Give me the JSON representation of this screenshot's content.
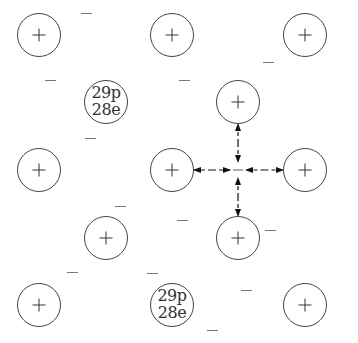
{
  "diagram": {
    "ion_radius": 22,
    "ions": [
      {
        "id": "ion-r1-c1",
        "x": 39,
        "y": 35,
        "symbol": "+"
      },
      {
        "id": "ion-r1-c2",
        "x": 172,
        "y": 35,
        "symbol": "+"
      },
      {
        "id": "ion-r1-c3",
        "x": 305,
        "y": 35,
        "symbol": "+"
      },
      {
        "id": "ion-r2-c1",
        "x": 106,
        "y": 102,
        "symbol": null,
        "label_line1": "29p",
        "label_line2": "28e"
      },
      {
        "id": "ion-r2-c2",
        "x": 238,
        "y": 102,
        "symbol": "+"
      },
      {
        "id": "ion-r3-c1",
        "x": 39,
        "y": 170,
        "symbol": "+"
      },
      {
        "id": "ion-r3-c2",
        "x": 172,
        "y": 170,
        "symbol": "+"
      },
      {
        "id": "ion-r3-c3",
        "x": 305,
        "y": 170,
        "symbol": "+"
      },
      {
        "id": "ion-r4-c1",
        "x": 106,
        "y": 238,
        "symbol": "+"
      },
      {
        "id": "ion-r4-c2",
        "x": 238,
        "y": 238,
        "symbol": "+"
      },
      {
        "id": "ion-r5-c1",
        "x": 39,
        "y": 305,
        "symbol": "+"
      },
      {
        "id": "ion-r5-c2",
        "x": 172,
        "y": 305,
        "symbol": null,
        "label_line1": "29p",
        "label_line2": "28e"
      },
      {
        "id": "ion-r5-c3",
        "x": 305,
        "y": 305,
        "symbol": "+"
      }
    ],
    "electrons": [
      {
        "x": 86,
        "y": 13
      },
      {
        "x": 50,
        "y": 80
      },
      {
        "x": 184,
        "y": 80
      },
      {
        "x": 268,
        "y": 62
      },
      {
        "x": 90,
        "y": 138
      },
      {
        "x": 120,
        "y": 206
      },
      {
        "x": 182,
        "y": 220
      },
      {
        "x": 270,
        "y": 230
      },
      {
        "x": 72,
        "y": 272
      },
      {
        "x": 152,
        "y": 273
      },
      {
        "x": 246,
        "y": 290
      },
      {
        "x": 212,
        "y": 330
      }
    ],
    "attraction_center": {
      "x": 238,
      "y": 170
    },
    "attraction_arrows": {
      "description": "Dashed double arrows between central free electron and four neighbouring ions",
      "targets": [
        "ion-r2-c2",
        "ion-r3-c2",
        "ion-r3-c3",
        "ion-r4-c2"
      ]
    },
    "colors": {
      "stroke": "#444444",
      "text": "#333333",
      "electron": "#777777",
      "arrow": "#111111",
      "background": "#ffffff"
    }
  }
}
